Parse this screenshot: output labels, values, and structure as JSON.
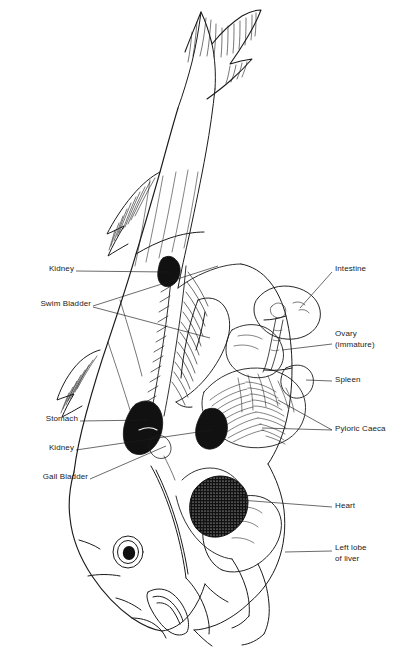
{
  "figure": {
    "style": "black-and-white line drawing",
    "orientation": "head at lower left, tail fin at top",
    "background_color": "#ffffff",
    "ink_color": "#1b1b1b",
    "canvas": {
      "width": 399,
      "height": 665
    }
  },
  "labels": {
    "kidney_upper": "Kidney",
    "swim_bladder": "Swim Bladder",
    "stomach": "Stomach",
    "kidney_lower": "Kidney",
    "gall_bladder": "Gall Bladder",
    "intestine": "Intestine",
    "ovary_line1": "Ovary",
    "ovary_line2": "(immature)",
    "spleen": "Spleen",
    "pyloric_caeca": "Pyloric Caeca",
    "heart": "Heart",
    "liver_line1": "Left lobe",
    "liver_line2": "of liver"
  },
  "callouts": [
    {
      "id": "kidney-upper",
      "label": "Kidney",
      "side": "left",
      "label_x": 42,
      "label_y": 268,
      "target_x": 168,
      "target_y": 272
    },
    {
      "id": "swim-bladder",
      "label": "Swim Bladder",
      "side": "left",
      "label_x": 16,
      "label_y": 303,
      "target_x": 215,
      "target_y": 268
    },
    {
      "id": "stomach",
      "label": "Stomach",
      "side": "left",
      "label_x": 37,
      "label_y": 418,
      "target_x": 146,
      "target_y": 423
    },
    {
      "id": "kidney-lower",
      "label": "Kidney",
      "side": "left",
      "label_x": 42,
      "label_y": 447,
      "target_x": 212,
      "target_y": 430
    },
    {
      "id": "gall-bladder",
      "label": "Gall Bladder",
      "side": "left",
      "label_x": 22,
      "label_y": 477,
      "target_x": 158,
      "target_y": 442
    },
    {
      "id": "intestine",
      "label": "Intestine",
      "side": "right",
      "label_x": 335,
      "label_y": 268,
      "target_x": 300,
      "target_y": 308
    },
    {
      "id": "ovary",
      "label": "Ovary (immature)",
      "side": "right",
      "label_x": 335,
      "label_y": 333,
      "target_x": 252,
      "target_y": 345
    },
    {
      "id": "spleen",
      "label": "Spleen",
      "side": "right",
      "label_x": 335,
      "label_y": 378,
      "target_x": 305,
      "target_y": 382
    },
    {
      "id": "pyloric-caeca",
      "label": "Pyloric Caeca",
      "side": "right",
      "label_x": 335,
      "label_y": 427,
      "target_x": 260,
      "target_y": 430
    },
    {
      "id": "heart",
      "label": "Heart",
      "side": "right",
      "label_x": 335,
      "label_y": 504,
      "target_x": 238,
      "target_y": 500
    },
    {
      "id": "left-lobe-of-liver",
      "label": "Left lobe of liver",
      "side": "right",
      "label_x": 335,
      "label_y": 546,
      "target_x": 285,
      "target_y": 552
    }
  ],
  "organs": [
    {
      "id": "kidney-upper-mass",
      "name": "kidney (upper dark mass)",
      "fill": "#111111"
    },
    {
      "id": "stomach-mass",
      "name": "stomach (dark mass)",
      "fill": "#111111"
    },
    {
      "id": "kidney-lower-mass",
      "name": "kidney (lower dark mass)",
      "fill": "#111111"
    },
    {
      "id": "heart-mass",
      "name": "heart (stippled dark mass)",
      "fill": "#111111"
    },
    {
      "id": "pyloric-caeca-mass",
      "name": "pyloric caeca (finger-like tufts)",
      "fill": "none"
    },
    {
      "id": "intestine-loop",
      "name": "intestine (rounded loop)",
      "fill": "none"
    },
    {
      "id": "swim-bladder-shape",
      "name": "swim bladder (elongated sac)",
      "fill": "none"
    },
    {
      "id": "liver-lobe",
      "name": "left lobe of liver",
      "fill": "none"
    },
    {
      "id": "eye",
      "name": "eye",
      "fill": "#111111"
    }
  ]
}
